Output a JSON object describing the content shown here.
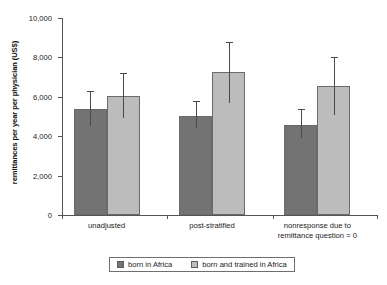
{
  "chart_data": {
    "type": "bar",
    "title": "",
    "xlabel": "",
    "ylabel": "remittances per year per physician (US$)",
    "ylim": [
      0,
      10000
    ],
    "yticks": [
      0,
      2000,
      4000,
      6000,
      8000,
      10000
    ],
    "ytick_labels": [
      "0",
      "2,000",
      "4,000",
      "6,000",
      "8,000",
      "10,000"
    ],
    "grid": false,
    "legend_position": "bottom",
    "categories": [
      "unadjusted",
      "post-stratified",
      "nonresponse due to\nremittance question = 0"
    ],
    "category_lines": [
      [
        "unadjusted"
      ],
      [
        "post-stratified"
      ],
      [
        "nonresponse due to",
        "remittance question = 0"
      ]
    ],
    "series": [
      {
        "name": "born in Africa",
        "color": "#737373",
        "values": [
          5400,
          5050,
          4550
        ],
        "error_low": [
          4500,
          4400,
          3900
        ],
        "error_high": [
          6300,
          5800,
          5400
        ]
      },
      {
        "name": "born and trained in Africa",
        "color": "#bcbcbc",
        "values": [
          6050,
          7250,
          6550
        ],
        "error_low": [
          4900,
          5700,
          5100
        ],
        "error_high": [
          7200,
          8800,
          8000
        ]
      }
    ]
  },
  "legend": {
    "items": [
      {
        "label": "born in Africa",
        "swatch": "series0"
      },
      {
        "label": "born and trained in Africa",
        "swatch": "series1"
      }
    ]
  }
}
